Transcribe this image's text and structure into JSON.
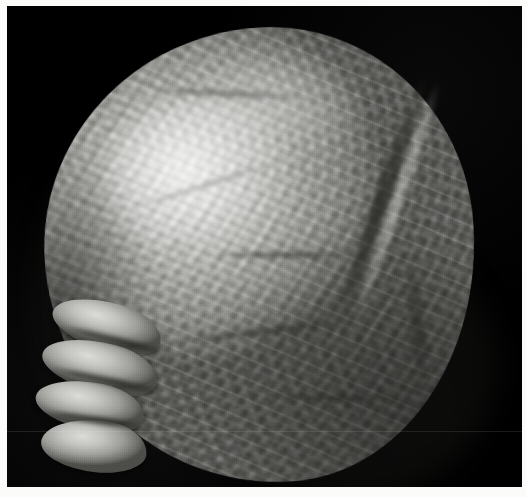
{
  "image": {
    "domain": "Natural-Image",
    "kind": "photograph",
    "color_mode": "grayscale",
    "width_px": 526,
    "height_px": 497,
    "alt_text": "Black-and-white photograph of an ovoid biological specimen with a deeply convoluted, gyri-like surface, lit from the upper left against a black background.",
    "caption": ""
  },
  "frame": {
    "border_color": "#fbfbfa",
    "border_left_px": 7,
    "border_top_px": 6,
    "border_right_px": 4,
    "border_bottom_px": 10
  },
  "scene": {
    "background_color": "#000000",
    "subject_name": "specimen",
    "subject_description": "ovoid convoluted mass",
    "lighting": "directional from upper left",
    "highlight_color": "#f2f2f0",
    "midtone_color": "#b2b2ae",
    "shadow_color": "#4b4b48"
  },
  "subject": {
    "bounds": {
      "left_px": 45,
      "top_px": 24,
      "right_px": 472,
      "bottom_px": 482
    },
    "features": [
      {
        "name": "crown-highlight",
        "label": "upper-left specular highlight"
      },
      {
        "name": "major-fissure",
        "label": "deep vertical fissure on right flank"
      },
      {
        "name": "lower-fissure",
        "label": "secondary groove lower right"
      },
      {
        "name": "left-lobes",
        "label": "four protruding lobes on lower left margin"
      },
      {
        "name": "gyri-texture",
        "label": "convoluted gyri and sulci across the surface"
      }
    ],
    "lobe_count": 4,
    "sulcus_count": 5
  },
  "artifacts": {
    "scan_seam_label": "horizontal scan seam",
    "scan_seam_y_px": 431,
    "film_grain_label": "film grain"
  }
}
